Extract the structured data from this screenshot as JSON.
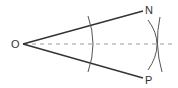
{
  "diagram": {
    "labels": {
      "vertex": "O",
      "ray_upper": "N",
      "ray_lower": "P"
    },
    "colors": {
      "stroke": "#333333",
      "dashed": "#999999",
      "background": "#ffffff"
    },
    "elements": [
      {
        "type": "ray",
        "from": "O",
        "to": "N"
      },
      {
        "type": "ray",
        "from": "O",
        "to": "P"
      },
      {
        "type": "dashed-line",
        "from": "O",
        "description": "angle bisector"
      },
      {
        "type": "arc",
        "center": "O",
        "description": "arc cutting both rays"
      },
      {
        "type": "arc",
        "description": "arc from intersection on ON"
      },
      {
        "type": "arc",
        "description": "arc from intersection on OP"
      }
    ]
  }
}
